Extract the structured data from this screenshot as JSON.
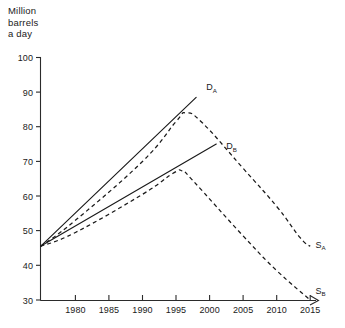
{
  "chart_data": {
    "type": "line",
    "title": "",
    "ylabel": "Million\nbarrels\na day",
    "xlabel": "",
    "ylim": [
      30,
      100
    ],
    "yticks": [
      30,
      40,
      50,
      60,
      70,
      80,
      90,
      100
    ],
    "xlim": [
      1974.8,
      2016
    ],
    "xticks": [
      1980,
      1985,
      1990,
      1995,
      2000,
      2005,
      2010,
      2015
    ],
    "grid": false,
    "legend": "inline-end-labels",
    "series": [
      {
        "name": "D_A",
        "label": "D",
        "sublabel": "A",
        "style": "solid",
        "points": [
          {
            "x": 1974.8,
            "y": 45.5
          },
          {
            "x": 1998.0,
            "y": 88.5
          }
        ]
      },
      {
        "name": "D_B",
        "label": "D",
        "sublabel": "B",
        "style": "solid",
        "points": [
          {
            "x": 1974.8,
            "y": 45.5
          },
          {
            "x": 2001.0,
            "y": 75.0
          }
        ]
      },
      {
        "name": "S_A",
        "label": "S",
        "sublabel": "A",
        "style": "dashed",
        "points": [
          {
            "x": 1974.8,
            "y": 45.5
          },
          {
            "x": 1980.0,
            "y": 53.0
          },
          {
            "x": 1990.0,
            "y": 70.0
          },
          {
            "x": 1995.0,
            "y": 81.5
          },
          {
            "x": 1996.5,
            "y": 84.0
          },
          {
            "x": 1999.0,
            "y": 81.0
          },
          {
            "x": 2005.0,
            "y": 68.0
          },
          {
            "x": 2010.0,
            "y": 57.0
          },
          {
            "x": 2013.5,
            "y": 48.0
          },
          {
            "x": 2015.0,
            "y": 45.5
          }
        ]
      },
      {
        "name": "S_B",
        "label": "S",
        "sublabel": "B",
        "style": "dashed",
        "points": [
          {
            "x": 1974.8,
            "y": 45.5
          },
          {
            "x": 1980.0,
            "y": 49.5
          },
          {
            "x": 1990.0,
            "y": 60.5
          },
          {
            "x": 1994.5,
            "y": 66.5
          },
          {
            "x": 1996.0,
            "y": 67.2
          },
          {
            "x": 1997.5,
            "y": 64.5
          },
          {
            "x": 2005.0,
            "y": 48.5
          },
          {
            "x": 2010.0,
            "y": 38.5
          },
          {
            "x": 2015.0,
            "y": 30.0
          }
        ]
      }
    ],
    "annotations": [
      {
        "name": "label-DA",
        "text": "D",
        "sub": "A",
        "x": 1999.5,
        "y": 90.5
      },
      {
        "name": "label-DB",
        "text": "D",
        "sub": "B",
        "x": 2002.5,
        "y": 73.5
      },
      {
        "name": "label-SA",
        "text": "S",
        "sub": "A",
        "x": 2015.8,
        "y": 45.0
      },
      {
        "name": "label-SB",
        "text": "S",
        "sub": "B",
        "x": 2015.8,
        "y": 31.8
      }
    ]
  },
  "axis": {
    "y_title_line1": "Million",
    "y_title_line2": "barrels",
    "y_title_line3": "a day",
    "y_tick_100": "100",
    "y_tick_90": "90",
    "y_tick_80": "80",
    "y_tick_70": "70",
    "y_tick_60": "60",
    "y_tick_50": "50",
    "y_tick_40": "40",
    "y_tick_30": "30",
    "x_tick_1980": "1980",
    "x_tick_1985": "1985",
    "x_tick_1990": "1990",
    "x_tick_1995": "1995",
    "x_tick_2000": "2000",
    "x_tick_2005": "2005",
    "x_tick_2010": "2010",
    "x_tick_2015": "2015"
  },
  "labels": {
    "da_main": "D",
    "da_sub": "A",
    "db_main": "D",
    "db_sub": "B",
    "sa_main": "S",
    "sa_sub": "A",
    "sb_main": "S",
    "sb_sub": "B"
  },
  "colors": {
    "ink": "#1a1a1a",
    "axis": "#2b2b2b",
    "background": "#ffffff"
  }
}
